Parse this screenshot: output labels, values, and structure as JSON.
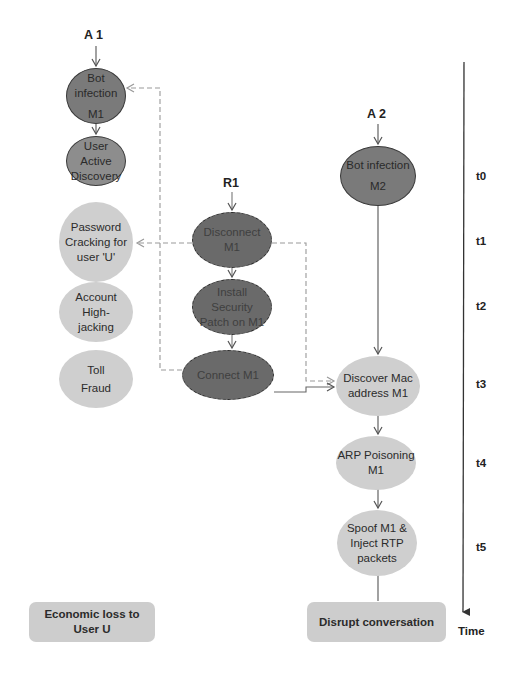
{
  "actors": {
    "a1": "A 1",
    "a2": "A 2",
    "r1": "R1"
  },
  "attack_a1": [
    {
      "id": "bot-infection-m1",
      "line1": "Bot infection",
      "line2": "M1"
    },
    {
      "id": "user-active-discovery",
      "line1": "User Active",
      "line2": "Discovery"
    },
    {
      "id": "password-cracking",
      "line1": "Password",
      "line2": "Cracking for",
      "line3": "user 'U'"
    },
    {
      "id": "account-highjacking",
      "line1": "Account",
      "line2": "High-",
      "line3": "jacking"
    },
    {
      "id": "toll-fraud",
      "line1": "Toll",
      "line2": "Fraud"
    }
  ],
  "response_r1": [
    {
      "id": "disconnect-m1",
      "line1": "Disconnect",
      "line2": "M1"
    },
    {
      "id": "install-patch",
      "line1": "Install",
      "line2": "Security",
      "line3": "Patch on M1"
    },
    {
      "id": "connect-m1",
      "line1": "Connect M1"
    }
  ],
  "attack_a2": [
    {
      "id": "bot-infection-m2",
      "line1": "Bot infection",
      "line2": "M2"
    },
    {
      "id": "discover-mac",
      "line1": "Discover Mac",
      "line2": "address M1"
    },
    {
      "id": "arp-poisoning",
      "line1": "ARP Poisoning",
      "line2": "M1"
    },
    {
      "id": "spoof-inject",
      "line1": "Spoof M1 &",
      "line2": "Inject RTP",
      "line3": "packets"
    }
  ],
  "outcomes": {
    "economic_loss": {
      "line1": "Economic loss to",
      "line2": "User U"
    },
    "disrupt": "Disrupt conversation"
  },
  "timeline": {
    "ticks": [
      "t0",
      "t1",
      "t2",
      "t3",
      "t4",
      "t5"
    ],
    "axis_label": "Time"
  },
  "colors": {
    "dark_node": "#7a7a7a",
    "response_node": "#6a6a6a",
    "light_node": "#cfcfcf",
    "edge": "#555555",
    "dashed_edge": "#888888"
  }
}
